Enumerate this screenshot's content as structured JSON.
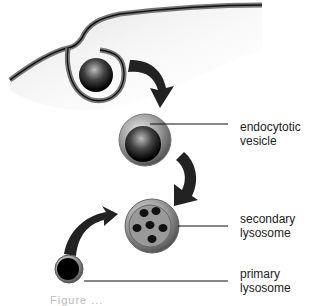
{
  "diagram": {
    "type": "endocytosis-lysosome-pathway",
    "labels": {
      "endocytotic_vesicle": [
        "endocytotic",
        "vesicle"
      ],
      "secondary_lysosome": [
        "secondary",
        "lysosome"
      ],
      "primary_lysosome": [
        "primary",
        "lysosome"
      ]
    },
    "caption_partial": "Figure ..."
  }
}
